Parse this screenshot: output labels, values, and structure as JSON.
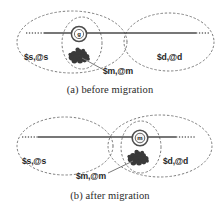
{
  "figure": {
    "kind": "two-panel-diagram"
  },
  "panels": [
    {
      "id": "a",
      "caption": "(a) before migration",
      "regions": [
        {
          "name": "source-region",
          "label": "$s,@s"
        },
        {
          "name": "destination-region",
          "label": "$d,@d"
        },
        {
          "name": "migrating-region",
          "label": "$m,@m"
        }
      ],
      "node": {
        "label": "g",
        "name": "guardian-node"
      }
    },
    {
      "id": "b",
      "caption": "(b) after migration",
      "regions": [
        {
          "name": "source-region",
          "label": "$s,@s"
        },
        {
          "name": "destination-region",
          "label": "$d,@d"
        },
        {
          "name": "migrating-region",
          "label": "$m,@m"
        }
      ],
      "node": {
        "label": "m",
        "name": "migrated-node"
      }
    }
  ],
  "colors": {
    "outline": "#7d7d7d",
    "line": "#4a4a4a",
    "blob": "#3a3a3a",
    "text": "#262626",
    "background": "#ffffff"
  }
}
